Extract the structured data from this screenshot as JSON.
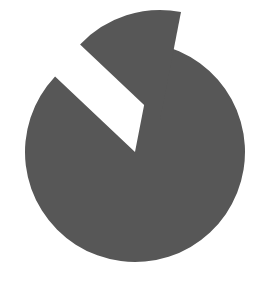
{
  "chart_data": {
    "type": "pie",
    "title": "",
    "legend": [],
    "labels": [
      "Main segment",
      "Exploded segment"
    ],
    "values": [
      84,
      16
    ],
    "exploded": [
      false,
      true
    ],
    "colors": [
      "#575757",
      "#575757"
    ],
    "background": "#ffffff",
    "geometry": {
      "center": [
        135,
        152
      ],
      "radius": 110,
      "start_angle_deg_clockwise_from_top": 11,
      "explode_offset": [
        25,
        -32
      ]
    }
  }
}
